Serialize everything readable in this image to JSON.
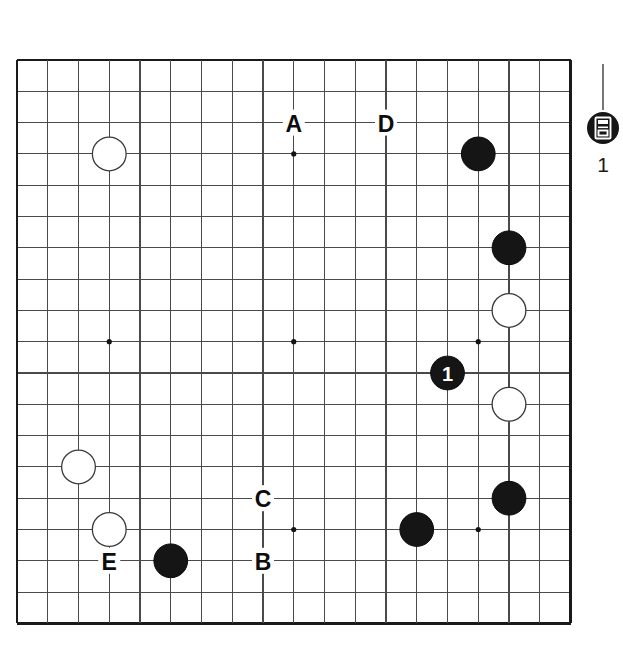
{
  "diagram": {
    "type": "go-board-diagram",
    "board": {
      "size": 19,
      "origin_x": 17,
      "origin_y": 60,
      "cell_w": 30.75,
      "cell_h": 31.3,
      "line_color": "#4a4a4a",
      "edge_color": "#1a1a1a",
      "background": "#ffffff",
      "star_points": [
        {
          "col": 4,
          "row": 4
        },
        {
          "col": 10,
          "row": 4
        },
        {
          "col": 16,
          "row": 4
        },
        {
          "col": 4,
          "row": 10
        },
        {
          "col": 10,
          "row": 10
        },
        {
          "col": 16,
          "row": 10
        },
        {
          "col": 4,
          "row": 16
        },
        {
          "col": 10,
          "row": 16
        },
        {
          "col": 16,
          "row": 16
        }
      ]
    },
    "stones": [
      {
        "col": 4,
        "row": 4,
        "color": "white",
        "label": ""
      },
      {
        "col": 16,
        "row": 4,
        "color": "black",
        "label": ""
      },
      {
        "col": 17,
        "row": 7,
        "color": "black",
        "label": ""
      },
      {
        "col": 17,
        "row": 9,
        "color": "white",
        "label": ""
      },
      {
        "col": 15,
        "row": 11,
        "color": "black",
        "label": "1"
      },
      {
        "col": 17,
        "row": 12,
        "color": "white",
        "label": ""
      },
      {
        "col": 3,
        "row": 14,
        "color": "white",
        "label": ""
      },
      {
        "col": 17,
        "row": 15,
        "color": "black",
        "label": ""
      },
      {
        "col": 4,
        "row": 16,
        "color": "white",
        "label": ""
      },
      {
        "col": 14,
        "row": 16,
        "color": "black",
        "label": ""
      },
      {
        "col": 6,
        "row": 17,
        "color": "black",
        "label": ""
      }
    ],
    "point_labels": [
      {
        "text": "A",
        "col": 10,
        "row": 3
      },
      {
        "text": "D",
        "col": 13,
        "row": 3
      },
      {
        "text": "C",
        "col": 9,
        "row": 15
      },
      {
        "text": "B",
        "col": 9,
        "row": 17
      },
      {
        "text": "E",
        "col": 4,
        "row": 17
      }
    ],
    "legend": {
      "caption": "1",
      "marker_icon": "black-stone-kanji-marker-icon",
      "stone_color": "black",
      "glyph_color": "#ffffff"
    },
    "colors": {
      "black_stone": "#151515",
      "white_stone": "#ffffff",
      "grid": "#4a4a4a",
      "border": "#1a1a1a",
      "text": "#0d0d0d"
    }
  }
}
